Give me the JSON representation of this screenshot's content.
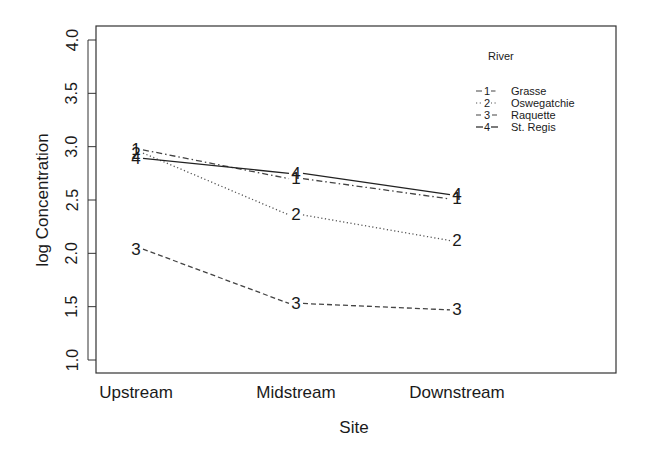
{
  "chart_data": {
    "type": "line",
    "title": "",
    "xlabel": "Site",
    "ylabel": "log Concentration",
    "categories": [
      "Upstream",
      "Midstream",
      "Downstream"
    ],
    "ylim": [
      1.0,
      4.0
    ],
    "yticks": [
      "1.0",
      "1.5",
      "2.0",
      "2.5",
      "3.0",
      "3.5",
      "4.0"
    ],
    "grid": false,
    "legend_title": "River",
    "legend_position": "top-right inside",
    "series": [
      {
        "name": "Grasse",
        "marker": "1",
        "linestyle": "dotdash",
        "values": [
          2.97,
          2.7,
          2.51
        ]
      },
      {
        "name": "Oswegatchie",
        "marker": "2",
        "linestyle": "dotted",
        "values": [
          2.94,
          2.36,
          2.12
        ]
      },
      {
        "name": "Raquette",
        "marker": "3",
        "linestyle": "dashed",
        "values": [
          2.04,
          1.53,
          1.47
        ]
      },
      {
        "name": "St. Regis",
        "marker": "4",
        "linestyle": "solid",
        "values": [
          2.89,
          2.75,
          2.55
        ]
      }
    ]
  }
}
